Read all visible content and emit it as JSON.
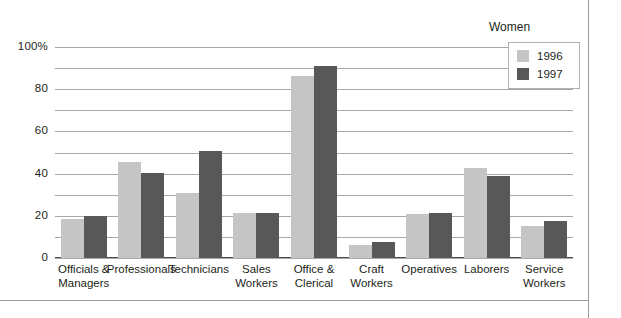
{
  "chart_data": {
    "type": "bar",
    "title": "",
    "xlabel": "",
    "ylabel": "",
    "ylim": [
      0,
      100
    ],
    "ytick_labels": [
      "100%",
      "80",
      "60",
      "40",
      "20",
      "0"
    ],
    "ytick_values": [
      100,
      80,
      60,
      40,
      20,
      0
    ],
    "gridlines": [
      0,
      10,
      20,
      30,
      40,
      50,
      60,
      70,
      80,
      90,
      100
    ],
    "grid": true,
    "grid_step": 10,
    "legend": {
      "title": "Women",
      "position": "top-right",
      "entries": [
        {
          "name": "1996",
          "color": "#c5c5c5"
        },
        {
          "name": "1997",
          "color": "#585858"
        }
      ]
    },
    "categories": [
      "Officials & Managers",
      "Professionals",
      "Technicians",
      "Sales Workers",
      "Office & Clerical",
      "Craft Workers",
      "Operatives",
      "Laborers",
      "Service Workers"
    ],
    "category_lines": [
      [
        "Officials &",
        "Managers"
      ],
      [
        "Professionals"
      ],
      [
        "Technicians"
      ],
      [
        "Sales",
        "Workers"
      ],
      [
        "Office &",
        "Clerical"
      ],
      [
        "Craft",
        "Workers"
      ],
      [
        "Operatives"
      ],
      [
        "Laborers"
      ],
      [
        "Service",
        "Workers"
      ]
    ],
    "series": [
      {
        "name": "1996",
        "color": "#c5c5c5",
        "values": [
          18.5,
          45.5,
          31,
          21.5,
          86.5,
          6,
          21,
          42.5,
          15
        ]
      },
      {
        "name": "1997",
        "color": "#585858",
        "values": [
          20,
          40.5,
          50.5,
          21.5,
          91,
          7.5,
          21.5,
          39,
          17.5
        ]
      }
    ]
  },
  "colors": {
    "series_1996": "#c5c5c5",
    "series_1997": "#585858",
    "gridline": "#a8a8a8",
    "axis": "#4d4d4d",
    "frame": "#9a9a9a",
    "text": "#231f20"
  }
}
